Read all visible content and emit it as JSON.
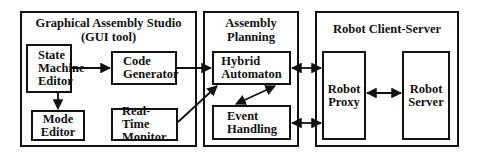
{
  "diagram": {
    "groups": [
      {
        "id": "gas",
        "title_line1": "Graphical Assembly  Studio",
        "title_line2": "(GUI tool)"
      },
      {
        "id": "ap",
        "title_line1": "Assembly",
        "title_line2": "Planning"
      },
      {
        "id": "rcs",
        "title_line1": "Robot Client-Server"
      }
    ],
    "nodes": {
      "state_machine_editor": {
        "line1": "State",
        "line2": "Machine",
        "line3": "Editor"
      },
      "mode_editor": {
        "line1": "Mode",
        "line2": "Editor"
      },
      "code_generator": {
        "line1": "Code",
        "line2": "Generator"
      },
      "real_time_monitor": {
        "line1": "Real-Time",
        "line2": "Monitor"
      },
      "hybrid_automaton": {
        "line1": "Hybrid",
        "line2": "Automaton"
      },
      "event_handling": {
        "line1": "Event",
        "line2": "Handling"
      },
      "robot_proxy": {
        "line1": "Robot",
        "line2": "Proxy"
      },
      "robot_server": {
        "line1": "Robot",
        "line2": "Server"
      }
    },
    "edges": [
      {
        "from": "State Machine Editor",
        "to": "Code Generator",
        "type": "directed"
      },
      {
        "from": "State Machine Editor",
        "to": "Mode Editor",
        "type": "directed"
      },
      {
        "from": "Code Generator",
        "to": "Hybrid Automaton",
        "type": "directed"
      },
      {
        "from": "Real-Time Monitor",
        "to": "Hybrid Automaton",
        "type": "directed"
      },
      {
        "from": "Hybrid Automaton",
        "to": "Event Handling",
        "type": "bidirectional"
      },
      {
        "from": "Hybrid Automaton",
        "to": "Robot Proxy",
        "type": "bidirectional"
      },
      {
        "from": "Event Handling",
        "to": "Robot Proxy",
        "type": "bidirectional"
      },
      {
        "from": "Robot Proxy",
        "to": "Robot Server",
        "type": "bidirectional"
      }
    ]
  }
}
